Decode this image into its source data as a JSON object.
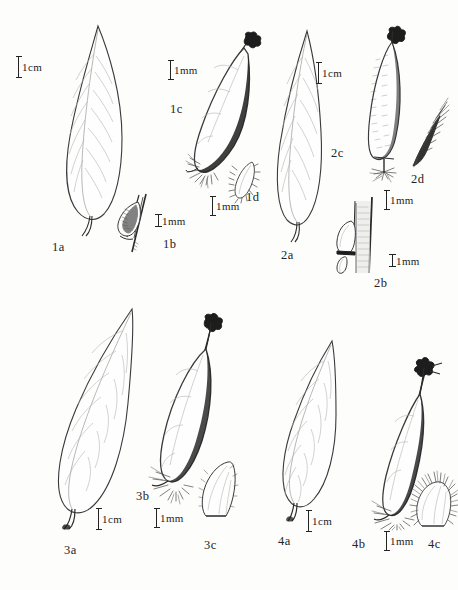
{
  "plate": {
    "title": "Botanical illustration plate",
    "background_color": "#fdfdfc",
    "ink_color": "#232323",
    "figure_count": 4
  },
  "figures": [
    {
      "id": "1a",
      "label": "1a",
      "subject": "lanceolate-leaf",
      "scale": {
        "text": "1cm",
        "unit": "cm",
        "value": 1,
        "style": "plain"
      }
    },
    {
      "id": "1b",
      "label": "1b",
      "subject": "bud-on-stem-detail",
      "scale": {
        "text": "1mm",
        "unit": "mm",
        "value": 1,
        "style": "serif"
      }
    },
    {
      "id": "1c",
      "label": "1c",
      "subject": "fruit-capsule",
      "scale": {
        "text": "1mm",
        "unit": "mm",
        "value": 1,
        "style": "plain"
      }
    },
    {
      "id": "1d",
      "label": "1d",
      "subject": "hairy-scale-bract",
      "scale": {
        "text": "1mm",
        "unit": "mm",
        "value": 1,
        "style": "plain"
      }
    },
    {
      "id": "2a",
      "label": "2a",
      "subject": "lanceolate-leaf",
      "scale": {
        "text": "1cm",
        "unit": "cm",
        "value": 1,
        "style": "plain"
      }
    },
    {
      "id": "2b",
      "label": "2b",
      "subject": "bud-on-stem-detail",
      "scale": {
        "text": "1mm",
        "unit": "mm",
        "value": 1,
        "style": "serif"
      }
    },
    {
      "id": "2c",
      "label": "2c",
      "subject": "club-shaped-capsule",
      "scale": {
        "text": "1mm",
        "unit": "mm",
        "value": 1,
        "style": "plain"
      }
    },
    {
      "id": "2d",
      "label": "2d",
      "subject": "hairy-scale-bract",
      "scale": null
    },
    {
      "id": "3a",
      "label": "3a",
      "subject": "lanceolate-leaf",
      "scale": {
        "text": "1cm",
        "unit": "cm",
        "value": 1,
        "style": "plain"
      }
    },
    {
      "id": "3b",
      "label": "3b",
      "subject": "fruit-capsule",
      "scale": {
        "text": "1mm",
        "unit": "mm",
        "value": 1,
        "style": "plain"
      }
    },
    {
      "id": "3c",
      "label": "3c",
      "subject": "scale-bract",
      "scale": null
    },
    {
      "id": "4a",
      "label": "4a",
      "subject": "lanceolate-leaf",
      "scale": {
        "text": "1cm",
        "unit": "cm",
        "value": 1,
        "style": "plain"
      }
    },
    {
      "id": "4b",
      "label": "4b",
      "subject": "fruit-capsule",
      "scale": {
        "text": "1mm",
        "unit": "mm",
        "value": 1,
        "style": "plain"
      }
    },
    {
      "id": "4c",
      "label": "4c",
      "subject": "hairy-scale-bract",
      "scale": null
    }
  ]
}
